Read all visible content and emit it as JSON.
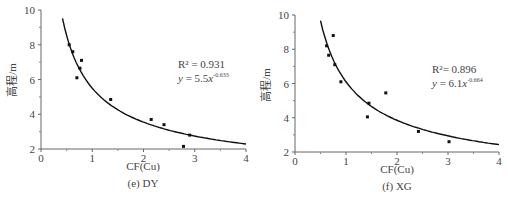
{
  "chart_data": [
    {
      "type": "scatter",
      "panel": "(e) DY",
      "caption": "(e) DY",
      "xlabel": "CF(Cu)",
      "ylabel": "高程/m",
      "xlim": [
        0,
        4
      ],
      "ylim": [
        2,
        10
      ],
      "xticks": [
        0,
        1,
        2,
        3,
        4
      ],
      "yticks": [
        2,
        4,
        6,
        8,
        10
      ],
      "points": [
        {
          "x": 0.55,
          "y": 8.0
        },
        {
          "x": 0.62,
          "y": 7.6
        },
        {
          "x": 0.7,
          "y": 6.1
        },
        {
          "x": 0.76,
          "y": 6.65
        },
        {
          "x": 0.79,
          "y": 7.1
        },
        {
          "x": 1.36,
          "y": 4.85
        },
        {
          "x": 2.15,
          "y": 3.7
        },
        {
          "x": 2.4,
          "y": 3.4
        },
        {
          "x": 2.78,
          "y": 2.15
        },
        {
          "x": 2.9,
          "y": 2.8
        }
      ],
      "fit": {
        "a": 5.5,
        "b": -0.633,
        "x_start": 0.42,
        "x_end": 4.0
      },
      "annotations": {
        "r2": "R² = 0.931",
        "eq_prefix": "y",
        "eq_mid": " = 5.5",
        "eq_x": "x",
        "eq_exp": "-0.633"
      },
      "grid": false
    },
    {
      "type": "scatter",
      "panel": "(f) XG",
      "caption": "(f) XG",
      "xlabel": "CF(Cu)",
      "ylabel": "高程/m",
      "xlim": [
        0,
        4
      ],
      "ylim": [
        2,
        10
      ],
      "xticks": [
        0,
        1,
        2,
        3,
        4
      ],
      "yticks": [
        2,
        4,
        6,
        8,
        10
      ],
      "points": [
        {
          "x": 0.62,
          "y": 8.2
        },
        {
          "x": 0.66,
          "y": 7.65
        },
        {
          "x": 0.75,
          "y": 8.8
        },
        {
          "x": 0.78,
          "y": 7.1
        },
        {
          "x": 0.9,
          "y": 6.1
        },
        {
          "x": 1.42,
          "y": 4.05
        },
        {
          "x": 1.45,
          "y": 4.85
        },
        {
          "x": 1.78,
          "y": 5.45
        },
        {
          "x": 2.42,
          "y": 3.2
        },
        {
          "x": 3.02,
          "y": 2.6
        }
      ],
      "fit": {
        "a": 6.1,
        "b": -0.664,
        "x_start": 0.5,
        "x_end": 4.0
      },
      "annotations": {
        "r2": "R²= 0.896",
        "eq_prefix": "y",
        "eq_mid": " = 6.1",
        "eq_x": "x",
        "eq_exp": "-0.664"
      },
      "grid": false
    }
  ]
}
